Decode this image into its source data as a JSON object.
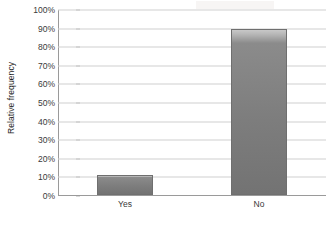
{
  "chart_data": {
    "type": "bar",
    "title": "",
    "xlabel": "",
    "ylabel": "Relative frequency",
    "categories": [
      "Yes",
      "No"
    ],
    "values": [
      11,
      89
    ],
    "value_unit": "%",
    "ylim": [
      0,
      100
    ],
    "ytick_values": [
      0,
      10,
      20,
      30,
      40,
      50,
      60,
      70,
      80,
      90,
      100
    ],
    "ytick_labels": [
      "0%",
      "10%",
      "20%",
      "30%",
      "40%",
      "50%",
      "60%",
      "70%",
      "80%",
      "90%",
      "100%"
    ],
    "grid": true,
    "grid_axis": "y",
    "legend": false,
    "legend_position": "none",
    "series": [
      {
        "name": "Relative frequency",
        "values": [
          11,
          89
        ],
        "color": "#7d7d7d"
      }
    ],
    "colors": {
      "bar_fill": "#7d7d7d",
      "bar_top_highlight": "#c8c8c8",
      "bar_border": "#6f6f6f",
      "gridline": "#cfcfcf",
      "axis_line": "#9a9a9a",
      "tick_mark": "#b6b6b6",
      "tick_text": "#3a3a3a",
      "axis_title_text": "#262626",
      "background": "#ffffff"
    }
  }
}
